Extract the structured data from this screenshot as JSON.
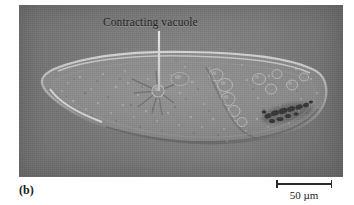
{
  "figure": {
    "panel_letter": "(b)",
    "specimen": "Paramecium",
    "modality": "differential interference contrast light micrograph"
  },
  "annotations": [
    {
      "id": "contractile-vacuole",
      "label": "Contracting vacuole",
      "leader": {
        "x": 139,
        "y_start": 26,
        "y_end": 86
      }
    }
  ],
  "scale_bar": {
    "value": "50",
    "unit": "µm",
    "label": "50 µm",
    "length_px": 56
  },
  "colors": {
    "plate_background": "#7e7e7e",
    "cytoplasm": "#8a8a8a",
    "membrane_highlight": "#c8c8c8",
    "dark_inclusion": "#2b2b2b",
    "label_text": "#232323",
    "leader_line": "#e0e0e0",
    "page_background": "#ffffff"
  },
  "cell_features": {
    "outline_note": "elongated slipper shape, rounded left tip, broad rounded right end",
    "radiating_canals": 7,
    "food_vacuoles": 9,
    "dark_mass_present": true
  }
}
